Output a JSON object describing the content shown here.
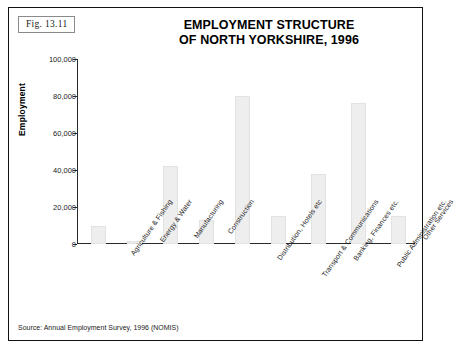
{
  "figure": {
    "label": "Fig.  13.11",
    "title_line1": "EMPLOYMENT STRUCTURE",
    "title_line2": "OF NORTH YORKSHIRE, 1996",
    "source": "Source: Annual Employment Survey, 1996 (NOMIS)"
  },
  "colors": {
    "bar_fill": "#eeeeee",
    "bar_border": "#e2e2e2",
    "axis": "#2a2a2a",
    "frame": "#111111",
    "text": "#000000"
  },
  "chart_data": {
    "type": "bar",
    "title": "EMPLOYMENT STRUCTURE OF NORTH YORKSHIRE, 1996",
    "xlabel": "",
    "ylabel": "Employment",
    "ylim": [
      0,
      100000
    ],
    "ytick_labels": [
      "100,000",
      "80,000",
      "60,000",
      "40,000",
      "20,000",
      "0"
    ],
    "ytick_values": [
      100000,
      80000,
      60000,
      40000,
      20000,
      0
    ],
    "grid": false,
    "legend": "none",
    "categories": [
      "Agriculture & Fishing",
      "Energy & Water",
      "Manufacturing",
      "Construction",
      "Distribution, Hotels etc",
      "Transport & Communications",
      "Banking, Finances etc.",
      "Public Administration etc.",
      "Other Services"
    ],
    "values": [
      10000,
      1500,
      42000,
      13000,
      80000,
      15000,
      38000,
      76000,
      15000
    ]
  }
}
